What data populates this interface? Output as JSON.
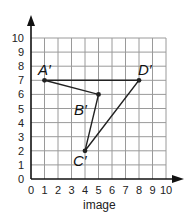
{
  "chart_data": {
    "type": "scatter",
    "title": "",
    "xlabel": "image",
    "ylabel": "",
    "xlim": [
      0,
      10
    ],
    "ylim": [
      0,
      10
    ],
    "grid": true,
    "x_ticks": [
      "0",
      "1",
      "2",
      "3",
      "4",
      "5",
      "6",
      "7",
      "8",
      "9",
      "10"
    ],
    "y_ticks": [
      "0",
      "1",
      "2",
      "3",
      "4",
      "5",
      "6",
      "7",
      "8",
      "9",
      "10"
    ],
    "points": [
      {
        "label": "A'",
        "x": 1,
        "y": 7
      },
      {
        "label": "B'",
        "x": 5,
        "y": 6
      },
      {
        "label": "C'",
        "x": 4,
        "y": 2
      },
      {
        "label": "D'",
        "x": 8,
        "y": 7
      }
    ],
    "polygon_order": [
      "A'",
      "B'",
      "C'",
      "D'"
    ]
  },
  "labels": {
    "x_axis_title": "image",
    "point_A": "A′",
    "point_B": "B′",
    "point_C": "C′",
    "point_D": "D′"
  },
  "colors": {
    "grid": "#9a9a9a",
    "axis": "#111111",
    "shape": "#222222"
  }
}
